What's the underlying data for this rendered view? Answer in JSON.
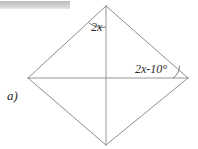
{
  "figure": {
    "part_label": "a)",
    "shape_name": "kite-quadrilateral",
    "background_color": "#ffffff",
    "line_color": "#808080",
    "text_color": "#2b2b2b",
    "angles": [
      {
        "id": "top-vertex-angle",
        "label": "2x",
        "vertex": "top"
      },
      {
        "id": "right-vertex-angle",
        "label": "2x-10°",
        "vertex": "right"
      }
    ],
    "vertices": {
      "top": {
        "x": 106,
        "y": 6
      },
      "left": {
        "x": 28,
        "y": 78
      },
      "right": {
        "x": 188,
        "y": 78
      },
      "bottom": {
        "x": 106,
        "y": 145
      },
      "center": {
        "x": 106,
        "y": 78
      }
    },
    "redaction": {
      "present": true,
      "color": "#c8c8c8"
    }
  }
}
